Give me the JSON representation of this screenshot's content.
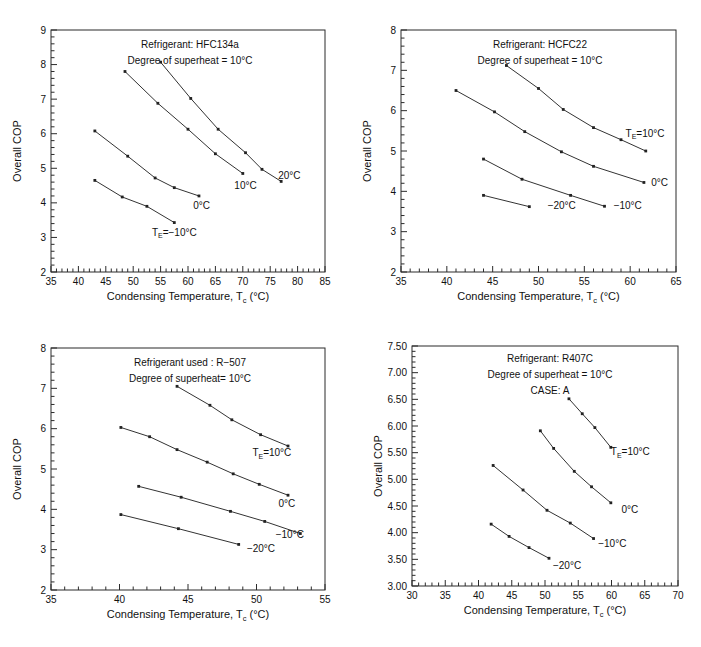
{
  "figure": {
    "background": "#ffffff",
    "line_color": "#333333",
    "axis_color": "#2b2b2b",
    "text_color": "#111111"
  },
  "common": {
    "xlabel_main": "Condensing Temperature,",
    "xlabel_sub": "T",
    "xlabel_sub_c": "c",
    "xlabel_unit": "(°C)",
    "ylabel": "Overall  COP",
    "te_prefix": "T",
    "te_sub": "E"
  },
  "chart_data": [
    {
      "id": "panel-hfc134a",
      "type": "line",
      "title": "Refrigerant: HFC134a",
      "subtitle": "Degree of superheat = 10°C",
      "annotations": [
        "Refrigerant: HFC134a",
        "Degree of superheat = 10°C"
      ],
      "xlabel": "Condensing Temperature, T_c (°C)",
      "ylabel": "Overall COP",
      "xlim": [
        35,
        85
      ],
      "ylim": [
        2,
        9
      ],
      "xticks": [
        35,
        40,
        45,
        50,
        55,
        60,
        65,
        70,
        75,
        80,
        85
      ],
      "yticks": [
        2,
        3,
        4,
        5,
        6,
        7,
        8,
        9
      ],
      "xminor_per_major": 5,
      "yminor_per_major": 5,
      "grid": false,
      "legend_position": "inline-end-of-line",
      "series": [
        {
          "name": "T_E=-10°C",
          "label": "Tₑ=−10°C",
          "label_prefix": "T",
          "label_sub": "E",
          "label_rest": "=−10°C",
          "x": [
            43.0,
            48.0,
            52.5,
            57.5
          ],
          "y": [
            4.65,
            4.17,
            3.9,
            3.43
          ]
        },
        {
          "name": "0°C",
          "label": "0°C",
          "x": [
            43.0,
            49.0,
            54.0,
            57.5,
            62.0
          ],
          "y": [
            6.08,
            5.35,
            4.72,
            4.44,
            4.2
          ]
        },
        {
          "name": "10°C",
          "label": "10°C",
          "x": [
            48.5,
            54.5,
            60.0,
            65.0,
            70.0
          ],
          "y": [
            7.8,
            6.88,
            6.13,
            5.42,
            4.85
          ]
        },
        {
          "name": "20°C",
          "label": "20°C",
          "x": [
            55.0,
            60.5,
            65.5,
            70.5,
            73.5,
            77.0
          ],
          "y": [
            8.07,
            7.02,
            6.13,
            5.45,
            4.97,
            4.62
          ]
        }
      ]
    },
    {
      "id": "panel-hcfc22",
      "type": "line",
      "title": "Refrigerant: HCFC22",
      "subtitle": "Degree of superheat = 10°C",
      "annotations": [
        "Refrigerant: HCFC22",
        "Degree of superheat = 10°C"
      ],
      "xlabel": "Condensing Temperature, T_c (°C)",
      "ylabel": "Overall COP",
      "xlim": [
        35,
        65
      ],
      "ylim": [
        2,
        8
      ],
      "xticks": [
        35,
        40,
        45,
        50,
        55,
        60,
        65
      ],
      "yticks": [
        2,
        3,
        4,
        5,
        6,
        7,
        8
      ],
      "xminor_per_major": 5,
      "yminor_per_major": 5,
      "grid": false,
      "legend_position": "inline-end-of-line",
      "series": [
        {
          "name": "-20°C",
          "label": "−20°C",
          "x": [
            44.0,
            49.0
          ],
          "y": [
            3.9,
            3.62
          ]
        },
        {
          "name": "-10°C",
          "label": "−10°C",
          "x": [
            44.0,
            48.2,
            53.5,
            57.2
          ],
          "y": [
            4.8,
            4.3,
            3.9,
            3.63
          ]
        },
        {
          "name": "0°C",
          "label": "0°C",
          "x": [
            41.0,
            45.2,
            48.5,
            52.5,
            56.0,
            61.5
          ],
          "y": [
            6.5,
            5.97,
            5.48,
            4.98,
            4.62,
            4.22
          ]
        },
        {
          "name": "T_E=10°C",
          "label": "Tₑ=10°C",
          "label_prefix": "T",
          "label_sub": "E",
          "label_rest": "=10°C",
          "x": [
            46.5,
            50.0,
            52.7,
            56.0,
            59.0,
            61.7
          ],
          "y": [
            7.12,
            6.55,
            6.03,
            5.58,
            5.28,
            5.0
          ]
        }
      ]
    },
    {
      "id": "panel-r507",
      "type": "line",
      "title": "Refrigerant used : R-507",
      "subtitle": "Degree of superheat= 10°C",
      "annotations": [
        "Refrigerant used : R−507",
        "Degree of superheat= 10°C"
      ],
      "xlabel": "Condensing Temperature, T_c (°C)",
      "ylabel": "Overall COP",
      "xlim": [
        35,
        55
      ],
      "ylim": [
        2,
        8
      ],
      "xticks": [
        35,
        40,
        45,
        50,
        55
      ],
      "yticks": [
        2,
        3,
        4,
        5,
        6,
        7,
        8
      ],
      "xminor_per_major": 5,
      "yminor_per_major": 5,
      "grid": false,
      "legend_position": "inline-end-of-line",
      "series": [
        {
          "name": "-20°C",
          "label": "−20°C",
          "x": [
            40.1,
            44.3,
            48.7
          ],
          "y": [
            3.87,
            3.52,
            3.13
          ]
        },
        {
          "name": "-10°C",
          "label": "−10°C",
          "x": [
            41.4,
            44.5,
            48.1,
            50.6,
            53.2
          ],
          "y": [
            4.57,
            4.3,
            3.95,
            3.7,
            3.4
          ]
        },
        {
          "name": "0°C",
          "label": "0°C",
          "x": [
            40.1,
            42.2,
            44.2,
            46.4,
            48.3,
            50.2,
            52.3
          ],
          "y": [
            6.03,
            5.8,
            5.48,
            5.17,
            4.88,
            4.62,
            4.35
          ]
        },
        {
          "name": "T_E=10°C",
          "label": "Tₑ=10°C",
          "label_prefix": "T",
          "label_sub": "E",
          "label_rest": "=10°C",
          "x": [
            44.2,
            46.6,
            48.2,
            50.3,
            52.3
          ],
          "y": [
            7.05,
            6.58,
            6.22,
            5.85,
            5.57
          ]
        }
      ]
    },
    {
      "id": "panel-r407c",
      "type": "line",
      "title": "Refrigerant: R407C",
      "subtitle": "Degree of superheat = 10°C",
      "case_label": "CASE: A",
      "annotations": [
        "Refrigerant: R407C",
        "Degree of superheat = 10°C",
        "CASE: A"
      ],
      "xlabel": "Condensing Temperature, T_c (°C)",
      "ylabel": "Overall COP",
      "xlim": [
        30,
        70
      ],
      "ylim": [
        3.0,
        7.5
      ],
      "xticks": [
        30,
        35,
        40,
        45,
        50,
        55,
        60,
        65,
        70
      ],
      "yticks": [
        3.0,
        3.5,
        4.0,
        4.5,
        5.0,
        5.5,
        6.0,
        6.5,
        7.0,
        7.5
      ],
      "ytick_labels": [
        "3.00",
        "3.50",
        "4.00",
        "4.50",
        "5.00",
        "5.50",
        "6.00",
        "6.50",
        "7.00",
        "7.50"
      ],
      "xminor_per_major": 5,
      "yminor_per_major": 5,
      "grid": false,
      "legend_position": "inline-end-of-line",
      "series": [
        {
          "name": "-20°C",
          "label": "−20°C",
          "x": [
            41.9,
            44.6,
            47.6,
            50.6
          ],
          "y": [
            4.16,
            3.93,
            3.72,
            3.52
          ]
        },
        {
          "name": "-10°C",
          "label": "−10°C",
          "x": [
            42.2,
            46.7,
            50.3,
            53.8,
            57.3
          ],
          "y": [
            5.26,
            4.8,
            4.42,
            4.18,
            3.89
          ]
        },
        {
          "name": "0°C",
          "label": "0°C",
          "x": [
            49.3,
            51.3,
            54.4,
            57.0,
            59.9
          ],
          "y": [
            5.91,
            5.58,
            5.15,
            4.86,
            4.56
          ]
        },
        {
          "name": "T_E=10°C",
          "label": "Tₑ=10°C",
          "label_prefix": "T",
          "label_sub": "E",
          "label_rest": "=10°C",
          "x": [
            53.6,
            55.6,
            57.5,
            59.9
          ],
          "y": [
            6.51,
            6.23,
            5.97,
            5.6
          ]
        }
      ]
    }
  ],
  "panel_labels": {
    "p1_series_tags": [
      {
        "text": "Tₑ=−10°C",
        "x": 57.5,
        "y": 3.05,
        "anchor": "middle"
      },
      {
        "text": "0°C",
        "x": 62.5,
        "y": 3.82,
        "anchor": "middle"
      },
      {
        "text": "10°C",
        "x": 70.5,
        "y": 4.4,
        "anchor": "middle"
      },
      {
        "text": "20°C",
        "x": 78.5,
        "y": 4.7,
        "anchor": "middle"
      }
    ],
    "p2_series_tags": [
      {
        "text": "−20°C",
        "x": 51.0,
        "y": 3.55,
        "anchor": "start"
      },
      {
        "text": "−10°C",
        "x": 58.2,
        "y": 3.56,
        "anchor": "start"
      },
      {
        "text": "0°C",
        "x": 62.3,
        "y": 4.12,
        "anchor": "start"
      },
      {
        "text": "Tₑ=10°C",
        "x": 59.5,
        "y": 5.35,
        "anchor": "start"
      }
    ],
    "p3_series_tags": [
      {
        "text": "−20°C",
        "x": 49.3,
        "y": 2.95,
        "anchor": "start"
      },
      {
        "text": "−10°C",
        "x": 51.4,
        "y": 3.28,
        "anchor": "start"
      },
      {
        "text": "0°C",
        "x": 51.6,
        "y": 4.07,
        "anchor": "start"
      },
      {
        "text": "Tₑ=10°C",
        "x": 49.7,
        "y": 5.32,
        "anchor": "start"
      }
    ],
    "p4_series_tags": [
      {
        "text": "−20°C",
        "x": 51.2,
        "y": 3.32,
        "anchor": "start"
      },
      {
        "text": "−10°C",
        "x": 58.0,
        "y": 3.73,
        "anchor": "start"
      },
      {
        "text": "0°C",
        "x": 61.5,
        "y": 4.37,
        "anchor": "start"
      },
      {
        "text": "Tₑ=10°C",
        "x": 59.9,
        "y": 5.45,
        "anchor": "start"
      }
    ]
  }
}
